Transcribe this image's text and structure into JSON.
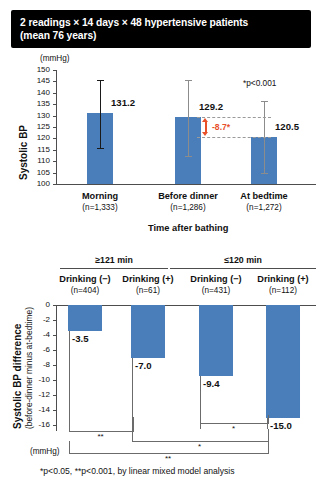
{
  "title": {
    "line1": "2 readings × 14 days × 48 hypertensive patients",
    "line2": "(mean 76 years)"
  },
  "footnote": "*p<0.05, **p<0.001, by linear mixed model analysis",
  "colors": {
    "bar": "#4a7ebb",
    "delta_accent": "#e8502a",
    "banner_bg": "#000000",
    "axis": "#4d4d4d"
  },
  "chart_data": [
    {
      "type": "bar",
      "id": "systolic-bp-by-time",
      "title": "",
      "xlabel": "",
      "ylabel": "Systolic BP",
      "yunit": "(mmHg)",
      "ylim": [
        100,
        150
      ],
      "yticks": [
        100,
        105,
        110,
        115,
        120,
        125,
        130,
        135,
        140,
        145,
        150
      ],
      "ytick_labels": [
        "100",
        "105",
        "110",
        "115",
        "120",
        "125",
        "130",
        "135",
        "140",
        "145",
        "150"
      ],
      "grid": false,
      "categories": [
        "Morning",
        "Before dinner",
        "At bedtime"
      ],
      "category_n": [
        "(n=1,333)",
        "(n=1,286)",
        "(n=1,272)"
      ],
      "values": [
        131.2,
        129.2,
        120.5
      ],
      "value_labels": [
        "131.2",
        "129.2",
        "120.5"
      ],
      "error_bars": [
        {
          "low": 116.0,
          "high": 145.6
        },
        {
          "low": 112.3,
          "high": 145.8
        },
        {
          "low": 104.9,
          "high": 136.2
        }
      ],
      "annotations": [
        {
          "kind": "delta-arrow",
          "label": "-8.7*",
          "from": 129.2,
          "to": 120.5
        },
        {
          "kind": "note",
          "label": "*p<0.001"
        }
      ]
    },
    {
      "type": "bar",
      "id": "systolic-bp-difference",
      "title": "",
      "xlabel": "Time after bathing",
      "ylabel": "Systolic BP difference",
      "ylabel_sub": "(before-dinner minus at-bedtime)",
      "yunit": "(mmHg)",
      "ylim": [
        -16,
        0
      ],
      "yticks": [
        0,
        -2,
        -4,
        -6,
        -8,
        -10,
        -12,
        -14,
        -16
      ],
      "ytick_labels": [
        "0",
        "-2",
        "-4",
        "-6",
        "-8",
        "-10",
        "-12",
        "-14",
        "-16"
      ],
      "grid": false,
      "groups": [
        {
          "label": "≥121 min",
          "members": [
            0,
            1
          ]
        },
        {
          "label": "≤120 min",
          "members": [
            2,
            3
          ]
        }
      ],
      "categories": [
        "Drinking (−)",
        "Drinking (+)",
        "Drinking (−)",
        "Drinking (+)"
      ],
      "category_n": [
        "(n=404)",
        "(n=61)",
        "(n=431)",
        "(n=112)"
      ],
      "values": [
        -3.5,
        -7.0,
        -9.4,
        -15.0
      ],
      "value_labels": [
        "-3.5",
        "-7.0",
        "-9.4",
        "-15.0"
      ],
      "significance_brackets": [
        {
          "from": 0,
          "to": 1,
          "label": "**"
        },
        {
          "from": 2,
          "to": 3,
          "label": "*"
        },
        {
          "from": 1,
          "to": 3,
          "label": "*"
        },
        {
          "from": 0,
          "to": 3,
          "label": "**"
        }
      ]
    }
  ]
}
